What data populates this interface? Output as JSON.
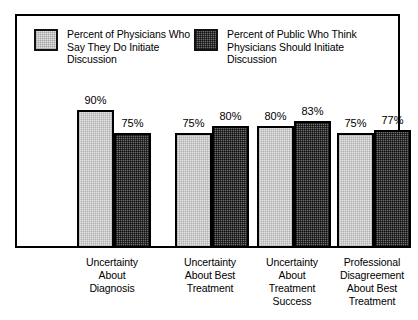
{
  "chart_data": {
    "type": "bar",
    "title": "",
    "subtitle": "",
    "xlabel": "",
    "ylabel": "",
    "ylim": [
      0,
      100
    ],
    "grid": false,
    "legend_position": "top-inside",
    "categories": [
      "Uncertainty\nAbout\nDiagnosis",
      "Uncertainty\nAbout Best\nTreatment",
      "Uncertainty\nAbout\nTreatment\nSuccess",
      "Professional\nDisagreement\nAbout Best\nTreatment"
    ],
    "series": [
      {
        "name": "Percent of Physicians Who\nSay They Do Initiate\nDiscussion",
        "values": [
          90,
          75,
          80,
          75
        ],
        "value_labels": [
          "90%",
          "75%",
          "80%",
          "75%"
        ],
        "fill": "light-gray",
        "color": "#e6e6e6"
      },
      {
        "name": "Percent of Public Who Think\nPhysicians Should Initiate\nDiscussion",
        "values": [
          75,
          80,
          83,
          77
        ],
        "value_labels": [
          "75%",
          "80%",
          "83%",
          "77%"
        ],
        "fill": "dark-dither",
        "color": "#707070"
      }
    ]
  },
  "legend": {
    "entries": [
      {
        "label": "Percent of Physicians Who\nSay They Do Initiate\nDiscussion",
        "swatch": "light-swatch"
      },
      {
        "label": "Percent of Public Who Think\nPhysicians Should Initiate\nDiscussion",
        "swatch": "dark-swatch"
      }
    ]
  },
  "colors": {
    "frame": "#000000",
    "background": "#ffffff",
    "series_light": "#e6e6e6",
    "series_dark": "#707070"
  }
}
